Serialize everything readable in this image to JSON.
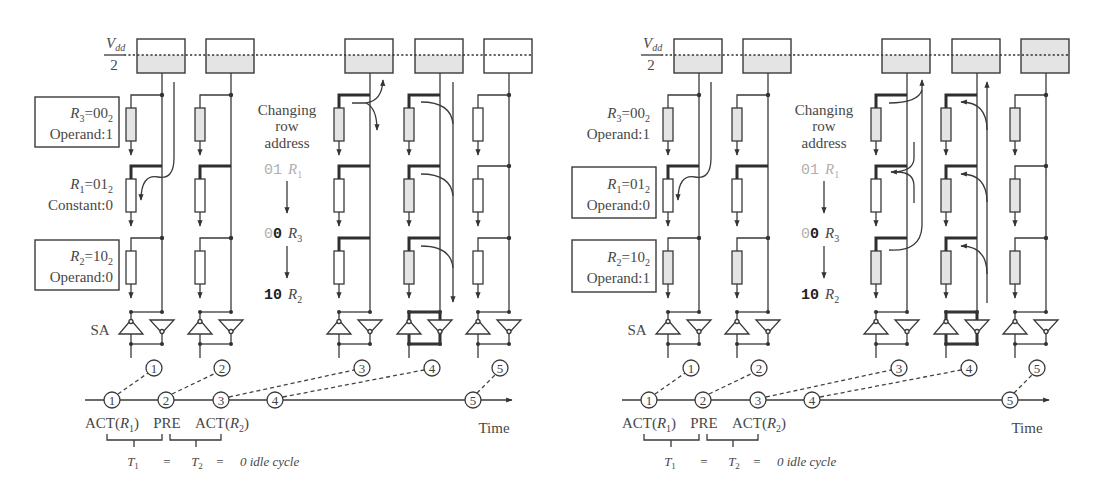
{
  "colors": {
    "line": "#3a3a3a",
    "charged_fill": "#e4e4e4",
    "empty_fill": "#ffffff",
    "text": "#474747",
    "dim_text": "#b0b0b0"
  },
  "panels": [
    {
      "vdd": {
        "v": "V",
        "sub": "dd",
        "den": "2"
      },
      "sa_label": "SA",
      "row_labels": [
        {
          "r": "R",
          "r_sub": "3",
          "eq": "=00",
          "base": "2",
          "desc": "Operand:1",
          "boxed": true
        },
        {
          "r": "R",
          "r_sub": "1",
          "eq": "=01",
          "base": "2",
          "desc": "Constant:0",
          "boxed": false
        },
        {
          "r": "R",
          "r_sub": "2",
          "eq": "=10",
          "base": "2",
          "desc": "Operand:0",
          "boxed": true
        }
      ],
      "address_change": {
        "title_lines": [
          "Changing",
          "row",
          "address"
        ],
        "steps": [
          {
            "bits_dim": "01",
            "bits_bold": "",
            "r": "R",
            "r_sub": "1"
          },
          {
            "bits_dim": "0",
            "bits_bold": "0",
            "r": "R",
            "r_sub": "3"
          },
          {
            "bits_dim": "",
            "bits_bold": "10",
            "r": "R",
            "r_sub": "2"
          }
        ]
      },
      "precharge_units": [
        {
          "upper_fill": "#ffffff",
          "lower_fill": "#e4e4e4"
        },
        {
          "upper_fill": "#ffffff",
          "lower_fill": "#e4e4e4"
        },
        {
          "upper_fill": "#ffffff",
          "lower_fill": "#e4e4e4"
        },
        {
          "upper_fill": "#ffffff",
          "lower_fill": "#e4e4e4"
        },
        {
          "upper_fill": "#ffffff",
          "lower_fill": "#ffffff"
        }
      ],
      "cells": [
        [
          {
            "shaded": true,
            "fill": "#e4e4e4"
          },
          {
            "shaded": false,
            "fill": "#ffffff"
          },
          {
            "shaded": false,
            "fill": "#ffffff"
          }
        ],
        [
          {
            "shaded": true,
            "fill": "#e4e4e4"
          },
          {
            "shaded": false,
            "fill": "#ffffff"
          },
          {
            "shaded": false,
            "fill": "#ffffff"
          }
        ],
        [
          {
            "shaded": true,
            "fill": "#e4e4e4"
          },
          {
            "shaded": false,
            "fill": "#ffffff"
          },
          {
            "shaded": false,
            "fill": "#ffffff"
          }
        ],
        [
          {
            "shaded": true,
            "fill": "#e4e4e4"
          },
          {
            "shaded": true,
            "fill": "#e4e4e4"
          },
          {
            "shaded": true,
            "fill": "#e4e4e4"
          }
        ],
        [
          {
            "shaded": false,
            "fill": "#ffffff"
          },
          {
            "shaded": false,
            "fill": "#ffffff"
          },
          {
            "shaded": false,
            "fill": "#ffffff"
          }
        ]
      ],
      "step_markers": [
        "1",
        "2",
        "3",
        "4",
        "5"
      ],
      "timeline": {
        "markers": [
          "1",
          "2",
          "3",
          "4",
          "5"
        ],
        "commands": [
          {
            "text": "ACT(",
            "r": "R",
            "r_sub": "1",
            "close": ")"
          },
          {
            "text": "PRE"
          },
          {
            "text": "ACT(",
            "r": "R",
            "r_sub": "2",
            "close": ")"
          }
        ],
        "axis_label": "Time"
      },
      "timing": {
        "t1": "T",
        "t1_sub": "1",
        "eq1": "=",
        "t2": "T",
        "t2_sub": "2",
        "eq2": "=",
        "idle": "0 idle cycle"
      }
    },
    {
      "vdd": {
        "v": "V",
        "sub": "dd",
        "den": "2"
      },
      "sa_label": "SA",
      "row_labels": [
        {
          "r": "R",
          "r_sub": "3",
          "eq": "=00",
          "base": "2",
          "desc": "Operand:1",
          "boxed": false
        },
        {
          "r": "R",
          "r_sub": "1",
          "eq": "=01",
          "base": "2",
          "desc": "Operand:0",
          "boxed": true
        },
        {
          "r": "R",
          "r_sub": "2",
          "eq": "=10",
          "base": "2",
          "desc": "Operand:1",
          "boxed": true
        }
      ],
      "address_change": {
        "title_lines": [
          "Changing",
          "row",
          "address"
        ],
        "steps": [
          {
            "bits_dim": "01",
            "bits_bold": "",
            "r": "R",
            "r_sub": "1"
          },
          {
            "bits_dim": "0",
            "bits_bold": "0",
            "r": "R",
            "r_sub": "3"
          },
          {
            "bits_dim": "",
            "bits_bold": "10",
            "r": "R",
            "r_sub": "2"
          }
        ]
      },
      "precharge_units": [
        {
          "upper_fill": "#ffffff",
          "lower_fill": "#e4e4e4"
        },
        {
          "upper_fill": "#ffffff",
          "lower_fill": "#e4e4e4"
        },
        {
          "upper_fill": "#ffffff",
          "lower_fill": "#e4e4e4"
        },
        {
          "upper_fill": "#ffffff",
          "lower_fill": "#e4e4e4"
        },
        {
          "upper_fill": "#e4e4e4",
          "lower_fill": "#e4e4e4"
        }
      ],
      "cells": [
        [
          {
            "shaded": true,
            "fill": "#e4e4e4"
          },
          {
            "shaded": false,
            "fill": "#ffffff"
          },
          {
            "shaded": true,
            "fill": "#e4e4e4"
          }
        ],
        [
          {
            "shaded": true,
            "fill": "#e4e4e4"
          },
          {
            "shaded": false,
            "fill": "#ffffff"
          },
          {
            "shaded": true,
            "fill": "#e4e4e4"
          }
        ],
        [
          {
            "shaded": true,
            "fill": "#e4e4e4"
          },
          {
            "shaded": false,
            "fill": "#ffffff"
          },
          {
            "shaded": true,
            "fill": "#e4e4e4"
          }
        ],
        [
          {
            "shaded": true,
            "fill": "#e4e4e4"
          },
          {
            "shaded": true,
            "fill": "#e4e4e4"
          },
          {
            "shaded": true,
            "fill": "#e4e4e4"
          }
        ],
        [
          {
            "shaded": true,
            "fill": "#e4e4e4"
          },
          {
            "shaded": true,
            "fill": "#e4e4e4"
          },
          {
            "shaded": true,
            "fill": "#e4e4e4"
          }
        ]
      ],
      "step_markers": [
        "1",
        "2",
        "3",
        "4",
        "5"
      ],
      "timeline": {
        "markers": [
          "1",
          "2",
          "3",
          "4",
          "5"
        ],
        "commands": [
          {
            "text": "ACT(",
            "r": "R",
            "r_sub": "1",
            "close": ")"
          },
          {
            "text": "PRE"
          },
          {
            "text": "ACT(",
            "r": "R",
            "r_sub": "2",
            "close": ")"
          }
        ],
        "axis_label": "Time"
      },
      "timing": {
        "t1": "T",
        "t1_sub": "1",
        "eq1": "=",
        "t2": "T",
        "t2_sub": "2",
        "eq2": "=",
        "idle": "0 idle cycle"
      }
    }
  ]
}
